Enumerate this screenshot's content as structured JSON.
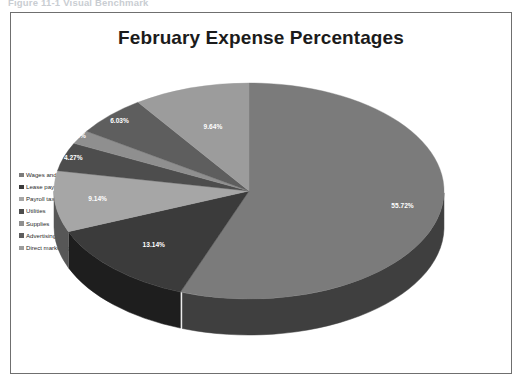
{
  "caption": "Figure 11-1  Visual Benchmark",
  "frame": {
    "border_color": "#6f6f6f",
    "background": "#ffffff"
  },
  "chart_data": {
    "type": "pie",
    "title": "February Expense Percentages",
    "xlabel": "",
    "ylabel": "",
    "legend_position": "left",
    "grid": false,
    "three_d": true,
    "categories": [
      "Wages and salaries",
      "Lease payment",
      "Payroll taxes",
      "Utilities",
      "Supplies",
      "Advertising",
      "Direct marketing"
    ],
    "values": [
      55.72,
      13.14,
      9.14,
      4.27,
      2.06,
      6.03,
      9.64
    ],
    "labels": [
      "55.72%",
      "13.14%",
      "9.14%",
      "4.27%",
      "2.06%",
      "6.03%",
      "9.64%"
    ],
    "unit": "%",
    "colors": [
      "#7b7b7b",
      "#3b3b3b",
      "#a6a6a6",
      "#4d4d4d",
      "#8f8f8f",
      "#5e5e5e",
      "#9c9c9c"
    ],
    "side_colors": [
      "#3f3f3f",
      "#1e1e1e",
      "#575757",
      "#272727",
      "#4a4a4a",
      "#303030",
      "#505050"
    ]
  },
  "colors": {
    "title_text": "#1b1b1b",
    "legend_text": "#2a2a2a",
    "label_text": "#ffffff",
    "caption_text": "#c9cdd2"
  }
}
